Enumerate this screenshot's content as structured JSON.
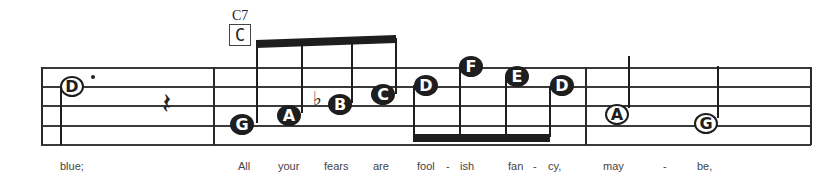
{
  "score": {
    "chord": {
      "name": "C7",
      "box_label": "C"
    },
    "staff": {
      "lines": 5
    },
    "measures": [
      {
        "notes": [
          {
            "letter": "D",
            "style": "open",
            "duration": "dotted half"
          },
          {
            "letter": "",
            "style": "rest",
            "duration": "quarter rest"
          }
        ],
        "lyrics": [
          "blue;"
        ]
      },
      {
        "notes": [
          {
            "letter": "G",
            "style": "filled",
            "duration": "eighth"
          },
          {
            "letter": "A",
            "style": "filled",
            "duration": "eighth"
          },
          {
            "letter": "B",
            "style": "filled",
            "duration": "eighth",
            "accidental": "♭"
          },
          {
            "letter": "C",
            "style": "filled",
            "duration": "eighth"
          },
          {
            "letter": "D",
            "style": "filled",
            "duration": "eighth"
          },
          {
            "letter": "F",
            "style": "filled",
            "duration": "eighth"
          },
          {
            "letter": "E",
            "style": "filled",
            "duration": "eighth"
          },
          {
            "letter": "D",
            "style": "filled",
            "duration": "eighth"
          }
        ],
        "lyrics": [
          "All",
          "your",
          "fears",
          "are",
          "fool",
          "-",
          "ish",
          "fan",
          "-",
          "cy,"
        ]
      },
      {
        "notes": [
          {
            "letter": "A",
            "style": "open",
            "duration": "half"
          },
          {
            "letter": "G",
            "style": "open",
            "duration": "half"
          }
        ],
        "lyrics": [
          "may",
          "-",
          "be,"
        ]
      }
    ]
  }
}
